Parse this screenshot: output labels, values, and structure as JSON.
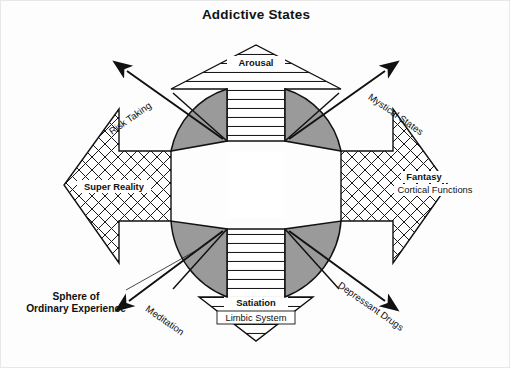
{
  "figure": {
    "title": "Addictive States",
    "background_color": "#ffffff",
    "ink_color": "#111111",
    "quadrant_fill": "#9a9a9a",
    "border_color": "#e8e8e8"
  },
  "axes": {
    "vertical_up": {
      "name": "arousal-arrow",
      "label": "Arousal",
      "hatch": "horizontal-lines",
      "direction": "up"
    },
    "vertical_down": {
      "name": "satiation-arrow",
      "label": "Satiation",
      "sublabel": "Limbic System",
      "hatch": "horizontal-lines",
      "direction": "down"
    },
    "horizontal_left": {
      "name": "super-reality-arrow",
      "label": "Super Reality",
      "hatch": "cross-hatch",
      "direction": "left"
    },
    "horizontal_right": {
      "name": "fantasy-arrow",
      "label": "Fantasy",
      "sublabel": "Cortical Functions",
      "hatch": "cross-hatch",
      "direction": "right"
    }
  },
  "diagonals": [
    {
      "id": "risk-taking",
      "label": "Risk Taking",
      "direction": "up-left"
    },
    {
      "id": "mystical-states",
      "label": "Mystical States",
      "direction": "up-right"
    },
    {
      "id": "meditation",
      "label": "Meditation",
      "direction": "down-left"
    },
    {
      "id": "depressant-drugs",
      "label": "Depressant Drugs",
      "direction": "down-right"
    }
  ],
  "annotations": {
    "sphere_line_1": "Sphere of",
    "sphere_line_2": "Ordinary Experience"
  },
  "quadrants": [
    {
      "id": "quadrant-top-left",
      "fill": "#9a9a9a"
    },
    {
      "id": "quadrant-top-right",
      "fill": "#9a9a9a"
    },
    {
      "id": "quadrant-bottom-left",
      "fill": "#9a9a9a"
    },
    {
      "id": "quadrant-bottom-right",
      "fill": "#9a9a9a"
    }
  ]
}
